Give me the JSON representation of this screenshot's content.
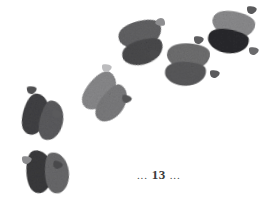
{
  "page": {
    "background_color": "#ffffff",
    "width": 272,
    "height": 210,
    "kind": "book-page-illustration"
  },
  "folio": {
    "leading_dots": "...",
    "number": "13",
    "trailing_dots": "...",
    "full_text": "... 13 ...",
    "color": "#3a3a3a"
  },
  "illustration": {
    "subject": "cloven-hoof-animal-track-trail",
    "description": "Trail of six two-lobed cloven hoof prints running diagonally from lower-left to upper-right, each accompanied by small triangular dewclaw marks.",
    "track_count": 6,
    "dewclaw_count": 11,
    "ink_colors": {
      "darkest": "#2e2e30",
      "dark": "#4a4a4c",
      "medium": "#6e6e70",
      "light": "#8e8e90",
      "lightest": "#a9a9ab",
      "faint": "#c9c9cb"
    },
    "tracks": [
      {
        "id": "track-1",
        "position_label": "bottom-left",
        "cx": 40,
        "cy": 172,
        "rotation": -8,
        "scale": 1.0,
        "lobe_left_color": "#3b3b3d",
        "lobe_right_color": "#6a6a6c"
      },
      {
        "id": "track-2",
        "position_label": "left",
        "cx": 36,
        "cy": 115,
        "rotation": 10,
        "scale": 0.97,
        "lobe_left_color": "#434345",
        "lobe_right_color": "#5c5c5e"
      },
      {
        "id": "track-3",
        "position_label": "center-left",
        "cx": 100,
        "cy": 92,
        "rotation": 34,
        "scale": 1.0,
        "lobe_left_color": "#8a8a8c",
        "lobe_right_color": "#7c7c7e"
      },
      {
        "id": "track-4",
        "position_label": "center-top",
        "cx": 140,
        "cy": 35,
        "rotation": 70,
        "scale": 1.02,
        "lobe_left_color": "#636365",
        "lobe_right_color": "#4c4c4e"
      },
      {
        "id": "track-5",
        "position_label": "right-middle",
        "cx": 188,
        "cy": 57,
        "rotation": 88,
        "scale": 1.0,
        "lobe_left_color": "#6f6f71",
        "lobe_right_color": "#5a5a5c"
      },
      {
        "id": "track-6",
        "position_label": "top-right",
        "cx": 233,
        "cy": 25,
        "rotation": 96,
        "scale": 1.0,
        "lobe_left_color": "#8c8c8e",
        "lobe_right_color": "#2b2b2d"
      }
    ],
    "dewclaws": [
      {
        "id": "dewclaw-1",
        "cx": 27,
        "cy": 160,
        "rotation": 0,
        "scale": 1.0,
        "color": "#8c8c8e"
      },
      {
        "id": "dewclaw-2",
        "cx": 58,
        "cy": 165,
        "rotation": 15,
        "scale": 1.0,
        "color": "#4a4a4c"
      },
      {
        "id": "dewclaw-3",
        "cx": 32,
        "cy": 90,
        "rotation": -5,
        "scale": 1.0,
        "color": "#4f4f51"
      },
      {
        "id": "dewclaw-4",
        "cx": 57,
        "cy": 114,
        "rotation": 20,
        "scale": 1.0,
        "color": "#5a5a5c"
      },
      {
        "id": "dewclaw-5",
        "cx": 107,
        "cy": 68,
        "rotation": 0,
        "scale": 1.0,
        "color": "#bcbcbe"
      },
      {
        "id": "dewclaw-6",
        "cx": 127,
        "cy": 99,
        "rotation": 10,
        "scale": 1.0,
        "color": "#55555 7"
      },
      {
        "id": "dewclaw-7",
        "cx": 160,
        "cy": 22,
        "rotation": 180,
        "scale": 1.0,
        "color": "#8e8e90"
      },
      {
        "id": "dewclaw-8",
        "cx": 155,
        "cy": 54,
        "rotation": 0,
        "scale": 1.0,
        "color": "#4a4a4c"
      },
      {
        "id": "dewclaw-9",
        "cx": 199,
        "cy": 40,
        "rotation": 0,
        "scale": 1.0,
        "color": "#5d5d5f"
      },
      {
        "id": "dewclaw-10",
        "cx": 215,
        "cy": 74,
        "rotation": 0,
        "scale": 1.0,
        "color": "#5a5a5c"
      },
      {
        "id": "dewclaw-11",
        "cx": 252,
        "cy": 10,
        "rotation": 0,
        "scale": 1.0,
        "color": "#5a5a5c"
      },
      {
        "id": "dewclaw-12",
        "cx": 254,
        "cy": 51,
        "rotation": 0,
        "scale": 1.0,
        "color": "#6a6a6c"
      }
    ]
  }
}
